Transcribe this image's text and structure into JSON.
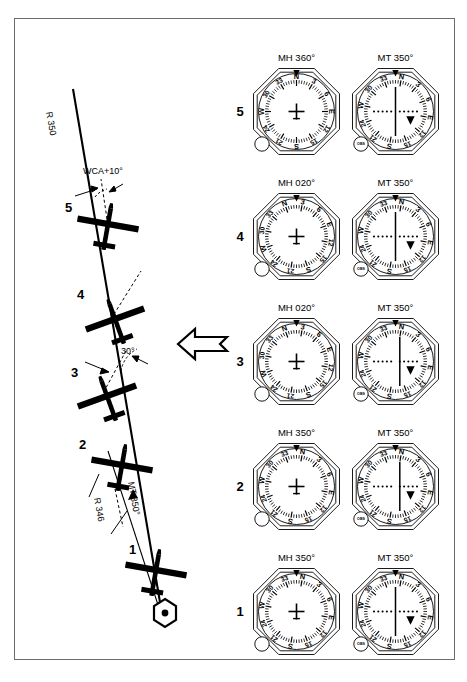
{
  "figure": {
    "background": "#ffffff",
    "ink": "#000000",
    "border_color": "#6d6d6d"
  },
  "diagram": {
    "wind_label": "WIND",
    "radial_label_top": "R 350",
    "wca_label": "WCA+10°",
    "intercept_angle_label": "30°",
    "track_label": "MT 350°",
    "radial_label_bottom": "R 346",
    "station_symbol": "vor-hexagon",
    "aircraft": [
      {
        "id": "5",
        "number": "5"
      },
      {
        "id": "4",
        "number": "4"
      },
      {
        "id": "3",
        "number": "3"
      },
      {
        "id": "2",
        "number": "2"
      },
      {
        "id": "1",
        "number": "1"
      }
    ]
  },
  "instruments": {
    "column_headers": [
      "MH",
      "MT"
    ],
    "compass_labels": [
      "N",
      "3",
      "6",
      "E",
      "12",
      "15",
      "S",
      "21",
      "24",
      "W",
      "30",
      "33"
    ],
    "obs_knob_label": "OBS",
    "rows": [
      {
        "number": "5",
        "heading_indicator": {
          "title": "MH 360°",
          "card_rotation_deg": 0,
          "type": "heading-indicator"
        },
        "vor_indicator": {
          "title": "MT 350°",
          "card_rotation_deg": 10,
          "cdi_deflection": 0,
          "to_from": "from",
          "type": "vor-cdi"
        }
      },
      {
        "number": "4",
        "heading_indicator": {
          "title": "MH 020°",
          "card_rotation_deg": -20,
          "type": "heading-indicator"
        },
        "vor_indicator": {
          "title": "MT 350°",
          "card_rotation_deg": 10,
          "cdi_deflection": 0,
          "to_from": "from",
          "type": "vor-cdi"
        }
      },
      {
        "number": "3",
        "heading_indicator": {
          "title": "MH 020°",
          "card_rotation_deg": -20,
          "type": "heading-indicator"
        },
        "vor_indicator": {
          "title": "MT 350°",
          "card_rotation_deg": 10,
          "cdi_deflection": 1,
          "to_from": "from",
          "type": "vor-cdi"
        }
      },
      {
        "number": "2",
        "heading_indicator": {
          "title": "MH 350°",
          "card_rotation_deg": 10,
          "type": "heading-indicator"
        },
        "vor_indicator": {
          "title": "MT 350°",
          "card_rotation_deg": 10,
          "cdi_deflection": 1,
          "to_from": "from",
          "type": "vor-cdi"
        }
      },
      {
        "number": "1",
        "heading_indicator": {
          "title": "MH 350°",
          "card_rotation_deg": 10,
          "type": "heading-indicator"
        },
        "vor_indicator": {
          "title": "MT 350°",
          "card_rotation_deg": 10,
          "cdi_deflection": 0,
          "to_from": "from",
          "type": "vor-cdi"
        }
      }
    ]
  }
}
